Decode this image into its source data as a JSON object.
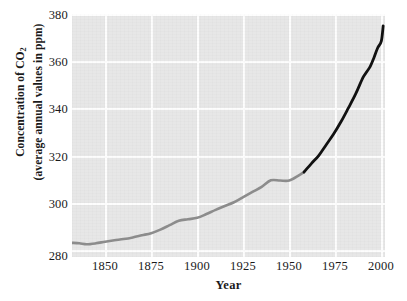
{
  "chart_data": {
    "type": "line",
    "title": "",
    "xlabel": "Year",
    "ylabel_line1": "Concentration of CO",
    "ylabel_sub": "2",
    "ylabel_line2": "(average annual values in ppm)",
    "xlim": [
      1832,
      2002
    ],
    "ylim": [
      278,
      381
    ],
    "grid": true,
    "legend": "none",
    "plot_background_color": "#e7e7e7",
    "gridline_color": "#fdfdfd",
    "xticks": [
      1850,
      1875,
      1900,
      1925,
      1950,
      1975,
      2000
    ],
    "xtick_labels": [
      "1850",
      "1875",
      "1900",
      "1925",
      "1950",
      "1975",
      "2000"
    ],
    "yticks": [
      280,
      300,
      320,
      340,
      360,
      380
    ],
    "ytick_labels": [
      "280",
      "300",
      "320",
      "340",
      "360",
      "380"
    ],
    "series": [
      {
        "name": "ice-core record",
        "color": "#8c8c8c",
        "line_width": 2.6,
        "x": [
          1832,
          1836,
          1840,
          1845,
          1850,
          1855,
          1860,
          1865,
          1870,
          1875,
          1880,
          1885,
          1890,
          1895,
          1900,
          1905,
          1910,
          1915,
          1920,
          1925,
          1930,
          1935,
          1940,
          1945,
          1950,
          1955,
          1958
        ],
        "y": [
          284.0,
          283.8,
          283.4,
          283.8,
          284.5,
          285.1,
          285.6,
          286.3,
          287.2,
          288.1,
          289.6,
          291.5,
          293.4,
          294.0,
          294.6,
          296.2,
          298.0,
          299.6,
          301.2,
          303.4,
          305.6,
          307.7,
          310.5,
          310.4,
          310.4,
          312.5,
          314.0
        ]
      },
      {
        "name": "Mauna Loa record",
        "color": "#111111",
        "line_width": 2.8,
        "x": [
          1958,
          1962,
          1966,
          1970,
          1974,
          1978,
          1982,
          1986,
          1990,
          1992,
          1994,
          1996,
          1998,
          2000,
          2001
        ],
        "y": [
          314.0,
          317.6,
          321.0,
          325.5,
          330.0,
          335.2,
          341.0,
          347.0,
          354.0,
          356.4,
          358.8,
          362.5,
          366.6,
          369.5,
          376.0
        ]
      }
    ],
    "annotations": []
  }
}
